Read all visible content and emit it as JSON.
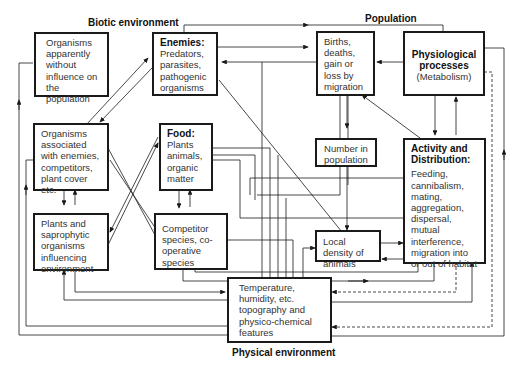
{
  "sections": {
    "biotic": "Biotic environment",
    "population": "Population",
    "physical": "Physical environment"
  },
  "boxes": {
    "no_influence": {
      "body": "Organisms apparently without influence on the population"
    },
    "enemies": {
      "title": "Enemies:",
      "body": "Predators, parasites, pathogenic organisms"
    },
    "births": {
      "body": "Births, deaths, gain or loss by migration"
    },
    "physiological": {
      "title": "Physiological processes",
      "body": "(Metabolism)"
    },
    "associated": {
      "body": "Organisms associated with enemies, competitors, plant cover etc."
    },
    "food": {
      "title": "Food:",
      "body": "Plants animals, organic matter"
    },
    "number": {
      "body": "Number in population"
    },
    "activity": {
      "title": "Activity and Distribution:",
      "body": "Feeding, cannibalism, mating, aggregation, dispersal, mutual interference, migration into or out of habitat"
    },
    "plants": {
      "body": "Plants and saprophytic organisms influencing environment"
    },
    "competitor": {
      "body": "Competitor species, co-operative species"
    },
    "density": {
      "body": "Local density of animals"
    },
    "temperature": {
      "body": "Temperature, humidity, etc. topography and physico-chemical features"
    }
  },
  "colors": {
    "line": "#1a1a1a",
    "box_border": "#1a1a1a",
    "text": "#333333"
  }
}
